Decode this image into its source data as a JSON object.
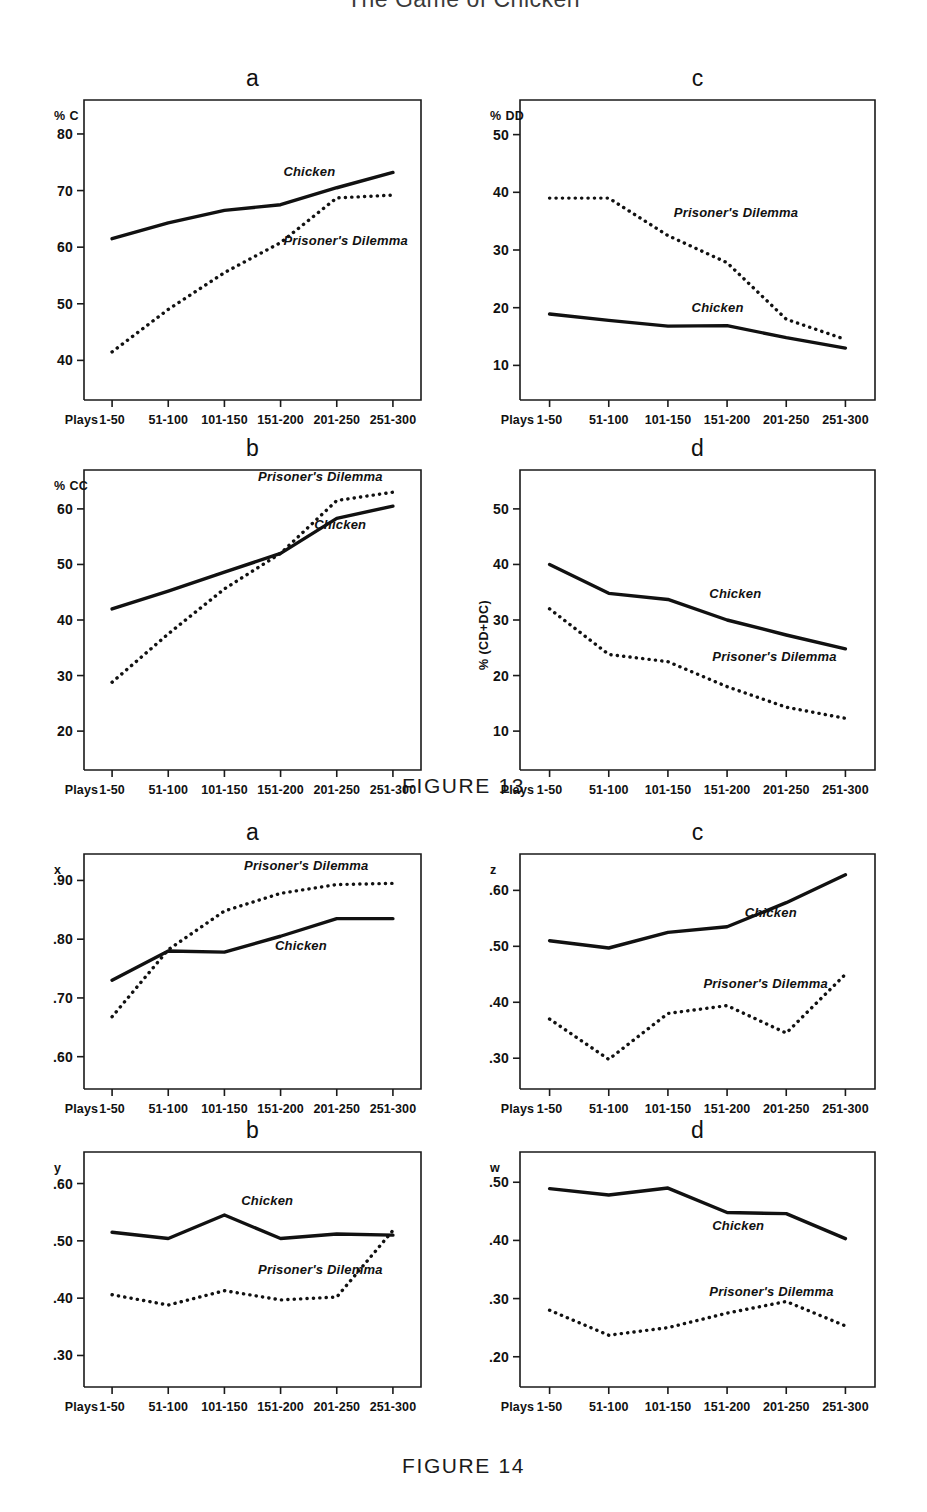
{
  "running_head": {
    "title": "The Game of Chicken"
  },
  "figures": [
    {
      "id": "fig13",
      "caption": "FIGURE 13"
    },
    {
      "id": "fig14",
      "caption": "FIGURE 14"
    }
  ],
  "x_axis": {
    "label": "Plays",
    "categories": [
      "1-50",
      "51-100",
      "101-150",
      "151-200",
      "201-250",
      "251-300"
    ]
  },
  "series_names": {
    "chicken": "Chicken",
    "pd": "Prisoner's Dilemma"
  },
  "chart_data": [
    {
      "id": "fig13-a",
      "type": "line",
      "panel": "a",
      "figure": "FIGURE 13",
      "title": "a",
      "ylabel": "% C",
      "xlabel": "Plays",
      "categories": [
        "1-50",
        "51-100",
        "101-150",
        "151-200",
        "201-250",
        "251-300"
      ],
      "yticks": [
        40,
        50,
        60,
        70,
        80
      ],
      "ylim": [
        33,
        86
      ],
      "grid": false,
      "legend": "inline-annotation",
      "series": [
        {
          "name": "Chicken",
          "style": "solid",
          "values": [
            61.5,
            64.3,
            66.5,
            67.5,
            70.5,
            73.2
          ],
          "label_x": 3.05,
          "label_y": 72.6
        },
        {
          "name": "Prisoner's Dilemma",
          "style": "dotted",
          "values": [
            41.5,
            49.0,
            55.5,
            60.8,
            68.7,
            69.2
          ],
          "label_x": 3.05,
          "label_y": 60.4
        }
      ]
    },
    {
      "id": "fig13-c",
      "type": "line",
      "panel": "c",
      "figure": "FIGURE 13",
      "title": "c",
      "ylabel": "% DD",
      "xlabel": "Plays",
      "categories": [
        "1-50",
        "51-100",
        "101-150",
        "151-200",
        "201-250",
        "251-300"
      ],
      "yticks": [
        10,
        20,
        30,
        40,
        50
      ],
      "ylim": [
        4,
        56
      ],
      "grid": false,
      "legend": "inline-annotation",
      "series": [
        {
          "name": "Prisoner's Dilemma",
          "style": "dotted",
          "values": [
            39.0,
            39.0,
            32.5,
            27.8,
            18.0,
            14.5
          ],
          "label_x": 2.1,
          "label_y": 35.7
        },
        {
          "name": "Chicken",
          "style": "solid",
          "values": [
            18.9,
            17.8,
            16.8,
            16.9,
            14.8,
            13.0
          ],
          "label_x": 2.4,
          "label_y": 19.2
        }
      ]
    },
    {
      "id": "fig13-b",
      "type": "line",
      "panel": "b",
      "figure": "FIGURE 13",
      "title": "b",
      "ylabel": "% CC",
      "xlabel": "Plays",
      "categories": [
        "1-50",
        "51-100",
        "101-150",
        "151-200",
        "201-250",
        "251-300"
      ],
      "yticks": [
        20,
        30,
        40,
        50,
        60
      ],
      "ylim": [
        13,
        67
      ],
      "grid": false,
      "legend": "inline-annotation",
      "series": [
        {
          "name": "Prisoner's Dilemma",
          "style": "dotted",
          "values": [
            28.8,
            37.5,
            45.6,
            52.0,
            61.5,
            63.0
          ],
          "label_x": 2.6,
          "label_y": 65.0
        },
        {
          "name": "Chicken",
          "style": "solid",
          "values": [
            42.0,
            45.2,
            48.6,
            52.0,
            58.3,
            60.5
          ],
          "label_x": 3.6,
          "label_y": 56.3
        }
      ]
    },
    {
      "id": "fig13-d",
      "type": "line",
      "panel": "d",
      "figure": "FIGURE 13",
      "title": "d",
      "ylabel": "% (CD+DC)",
      "xlabel": "Plays",
      "categories": [
        "1-50",
        "51-100",
        "101-150",
        "151-200",
        "201-250",
        "251-300"
      ],
      "yticks": [
        10,
        20,
        30,
        40,
        50
      ],
      "ylim": [
        3,
        57
      ],
      "grid": false,
      "legend": "inline-annotation",
      "series": [
        {
          "name": "Chicken",
          "style": "solid",
          "values": [
            40.0,
            34.8,
            33.7,
            30.0,
            27.3,
            24.8
          ],
          "label_x": 2.7,
          "label_y": 34.0
        },
        {
          "name": "Prisoner's Dilemma",
          "style": "dotted",
          "values": [
            32.0,
            23.8,
            22.5,
            18.0,
            14.3,
            12.3
          ],
          "label_x": 2.75,
          "label_y": 22.6
        }
      ]
    },
    {
      "id": "fig14-a",
      "type": "line",
      "panel": "a",
      "figure": "FIGURE 14",
      "title": "a",
      "ylabel": "x",
      "xlabel": "Plays",
      "categories": [
        "1-50",
        "51-100",
        "101-150",
        "151-200",
        "201-250",
        "251-300"
      ],
      "yticks": [
        0.6,
        0.7,
        0.8,
        0.9
      ],
      "ytick_labels": [
        ".60",
        ".70",
        ".80",
        ".90"
      ],
      "ylim": [
        0.545,
        0.945
      ],
      "grid": false,
      "legend": "inline-annotation",
      "series": [
        {
          "name": "Prisoner's Dilemma",
          "style": "dotted",
          "values": [
            0.668,
            0.782,
            0.848,
            0.878,
            0.893,
            0.895
          ],
          "label_x": 2.35,
          "label_y": 0.917
        },
        {
          "name": "Chicken",
          "style": "solid",
          "values": [
            0.73,
            0.78,
            0.778,
            0.805,
            0.835,
            0.835
          ],
          "label_x": 2.9,
          "label_y": 0.782
        }
      ]
    },
    {
      "id": "fig14-c",
      "type": "line",
      "panel": "c",
      "figure": "FIGURE 14",
      "title": "c",
      "ylabel": "z",
      "xlabel": "Plays",
      "categories": [
        "1-50",
        "51-100",
        "101-150",
        "151-200",
        "201-250",
        "251-300"
      ],
      "yticks": [
        0.3,
        0.4,
        0.5,
        0.6
      ],
      "ytick_labels": [
        ".30",
        ".40",
        ".50",
        ".60"
      ],
      "ylim": [
        0.245,
        0.665
      ],
      "grid": false,
      "legend": "inline-annotation",
      "series": [
        {
          "name": "Chicken",
          "style": "solid",
          "values": [
            0.51,
            0.497,
            0.525,
            0.535,
            0.578,
            0.628
          ],
          "label_x": 3.3,
          "label_y": 0.552
        },
        {
          "name": "Prisoner's Dilemma",
          "style": "dotted",
          "values": [
            0.37,
            0.298,
            0.38,
            0.394,
            0.345,
            0.45
          ],
          "label_x": 2.6,
          "label_y": 0.425
        }
      ]
    },
    {
      "id": "fig14-b",
      "type": "line",
      "panel": "b",
      "figure": "FIGURE 14",
      "title": "b",
      "ylabel": "y",
      "xlabel": "Plays",
      "categories": [
        "1-50",
        "51-100",
        "101-150",
        "151-200",
        "201-250",
        "251-300"
      ],
      "yticks": [
        0.3,
        0.4,
        0.5,
        0.6
      ],
      "ytick_labels": [
        ".30",
        ".40",
        ".50",
        ".60"
      ],
      "ylim": [
        0.245,
        0.655
      ],
      "grid": false,
      "legend": "inline-annotation",
      "series": [
        {
          "name": "Chicken",
          "style": "solid",
          "values": [
            0.515,
            0.504,
            0.545,
            0.504,
            0.512,
            0.51
          ],
          "label_x": 2.3,
          "label_y": 0.562
        },
        {
          "name": "Prisoner's Dilemma",
          "style": "dotted",
          "values": [
            0.406,
            0.388,
            0.413,
            0.397,
            0.402,
            0.518
          ],
          "label_x": 2.6,
          "label_y": 0.443
        }
      ]
    },
    {
      "id": "fig14-d",
      "type": "line",
      "panel": "d",
      "figure": "FIGURE 14",
      "title": "d",
      "ylabel": "w",
      "xlabel": "Plays",
      "categories": [
        "1-50",
        "51-100",
        "101-150",
        "151-200",
        "201-250",
        "251-300"
      ],
      "yticks": [
        0.2,
        0.3,
        0.4,
        0.5
      ],
      "ytick_labels": [
        ".20",
        ".30",
        ".40",
        ".50"
      ],
      "ylim": [
        0.148,
        0.552
      ],
      "grid": false,
      "legend": "inline-annotation",
      "series": [
        {
          "name": "Chicken",
          "style": "solid",
          "values": [
            0.489,
            0.478,
            0.49,
            0.448,
            0.446,
            0.403
          ],
          "label_x": 2.75,
          "label_y": 0.418
        },
        {
          "name": "Prisoner's Dilemma",
          "style": "dotted",
          "values": [
            0.28,
            0.237,
            0.25,
            0.275,
            0.295,
            0.253
          ],
          "label_x": 2.7,
          "label_y": 0.305
        }
      ]
    }
  ],
  "layout": {
    "panels": [
      {
        "id": "fig13-a",
        "left": 47,
        "top": 14,
        "w": 400,
        "h": 360,
        "plot": {
          "x": 37,
          "y": 40,
          "w": 337,
          "h": 300
        }
      },
      {
        "id": "fig13-c",
        "left": 470,
        "top": 14,
        "w": 420,
        "h": 360,
        "plot": {
          "x": 50,
          "y": 40,
          "w": 355,
          "h": 300
        }
      },
      {
        "id": "fig13-b",
        "left": 47,
        "top": 384,
        "w": 400,
        "h": 360,
        "plot": {
          "x": 37,
          "y": 40,
          "w": 337,
          "h": 300
        }
      },
      {
        "id": "fig13-d",
        "left": 470,
        "top": 384,
        "w": 420,
        "h": 360,
        "plot": {
          "x": 50,
          "y": 40,
          "w": 355,
          "h": 300
        }
      },
      {
        "id": "fig14-a",
        "left": 47,
        "top": 10,
        "w": 400,
        "h": 295,
        "plot": {
          "x": 37,
          "y": 38,
          "w": 337,
          "h": 235
        }
      },
      {
        "id": "fig14-c",
        "left": 470,
        "top": 10,
        "w": 420,
        "h": 295,
        "plot": {
          "x": 50,
          "y": 38,
          "w": 355,
          "h": 235
        }
      },
      {
        "id": "fig14-b",
        "left": 47,
        "top": 308,
        "w": 400,
        "h": 295,
        "plot": {
          "x": 37,
          "y": 38,
          "w": 337,
          "h": 235
        }
      },
      {
        "id": "fig14-d",
        "left": 470,
        "top": 308,
        "w": 420,
        "h": 295,
        "plot": {
          "x": 50,
          "y": 38,
          "w": 355,
          "h": 235
        }
      }
    ]
  }
}
